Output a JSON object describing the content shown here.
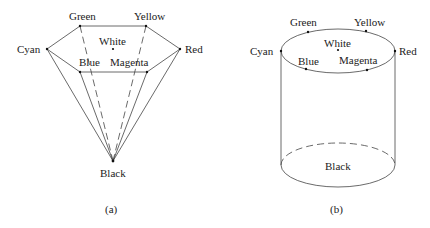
{
  "figure": {
    "panel_a": {
      "caption": "(a)",
      "shape": "hexcone",
      "vertices": {
        "green": {
          "label": "Green",
          "x": 80,
          "y": 26
        },
        "yellow": {
          "label": "Yellow",
          "x": 146,
          "y": 26
        },
        "cyan": {
          "label": "Cyan",
          "x": 47,
          "y": 49
        },
        "red": {
          "label": "Red",
          "x": 180,
          "y": 49
        },
        "blue": {
          "label": "Blue",
          "x": 80,
          "y": 72
        },
        "magenta": {
          "label": "Magenta",
          "x": 147,
          "y": 72
        },
        "white": {
          "label": "White",
          "x": 113,
          "y": 49
        },
        "black": {
          "label": "Black",
          "x": 113,
          "y": 161
        }
      }
    },
    "panel_b": {
      "caption": "(b)",
      "shape": "cylinder",
      "labels": {
        "green": "Green",
        "yellow": "Yellow",
        "cyan": "Cyan",
        "red": "Red",
        "blue": "Blue",
        "magenta": "Magenta",
        "white": "White",
        "black": "Black"
      }
    }
  }
}
